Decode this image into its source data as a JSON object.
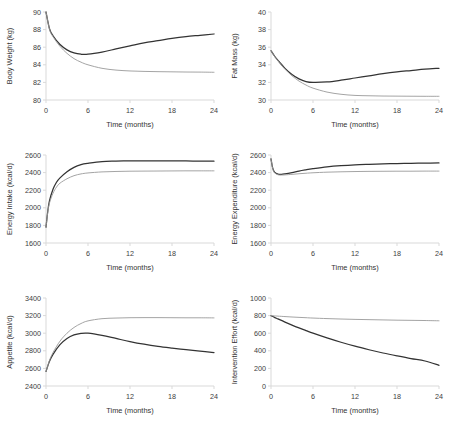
{
  "figure": {
    "width": 450,
    "height": 429,
    "background": "#ffffff",
    "series_colors": {
      "dark": "#333333",
      "light": "#9a9a9a"
    },
    "shared_xlabel": "Time (months)",
    "shared_xticks": [
      0,
      6,
      12,
      18,
      24
    ]
  },
  "chart_data": [
    {
      "type": "line",
      "title": "",
      "xlabel": "Time (months)",
      "ylabel": "Body Weight (kg)",
      "xlim": [
        0,
        24
      ],
      "ylim": [
        80,
        90
      ],
      "xticks": [
        0,
        6,
        12,
        18,
        24
      ],
      "yticks": [
        80,
        82,
        84,
        86,
        88,
        90
      ],
      "grid": false,
      "legend": "none",
      "x": [
        0,
        0.5,
        1,
        2,
        3,
        4,
        5,
        6,
        8,
        10,
        12,
        14,
        16,
        18,
        20,
        22,
        24
      ],
      "series": [
        {
          "name": "dark",
          "color": "#333333",
          "values": [
            90.0,
            88.1,
            87.3,
            86.3,
            85.7,
            85.35,
            85.2,
            85.2,
            85.45,
            85.8,
            86.15,
            86.5,
            86.75,
            87.0,
            87.2,
            87.35,
            87.5
          ]
        },
        {
          "name": "light",
          "color": "#9a9a9a",
          "values": [
            90.0,
            88.05,
            87.2,
            86.1,
            85.3,
            84.7,
            84.3,
            84.0,
            83.6,
            83.4,
            83.3,
            83.25,
            83.22,
            83.2,
            83.18,
            83.17,
            83.15
          ]
        }
      ]
    },
    {
      "type": "line",
      "title": "",
      "xlabel": "Time (months)",
      "ylabel": "Fat Mass (kg)",
      "xlim": [
        0,
        24
      ],
      "ylim": [
        30,
        40
      ],
      "xticks": [
        0,
        6,
        12,
        18,
        24
      ],
      "yticks": [
        30,
        32,
        34,
        36,
        38,
        40
      ],
      "grid": false,
      "legend": "none",
      "x": [
        0,
        0.5,
        1,
        2,
        3,
        4,
        5,
        6,
        8,
        10,
        12,
        14,
        16,
        18,
        20,
        22,
        24
      ],
      "series": [
        {
          "name": "dark",
          "color": "#333333",
          "values": [
            35.6,
            35.0,
            34.5,
            33.6,
            32.9,
            32.4,
            32.1,
            32.0,
            32.05,
            32.25,
            32.5,
            32.75,
            33.0,
            33.2,
            33.35,
            33.5,
            33.6
          ]
        },
        {
          "name": "light",
          "color": "#9a9a9a",
          "values": [
            35.6,
            34.95,
            34.45,
            33.5,
            32.75,
            32.15,
            31.7,
            31.35,
            30.9,
            30.65,
            30.52,
            30.48,
            30.45,
            30.44,
            30.43,
            30.42,
            30.42
          ]
        }
      ]
    },
    {
      "type": "line",
      "title": "",
      "xlabel": "Time (months)",
      "ylabel": "Energy Intake (kcal/d)",
      "xlim": [
        0,
        24
      ],
      "ylim": [
        1600,
        2600
      ],
      "xticks": [
        0,
        6,
        12,
        18,
        24
      ],
      "yticks": [
        1600,
        1800,
        2000,
        2200,
        2400,
        2600
      ],
      "grid": false,
      "legend": "none",
      "x": [
        0,
        0.25,
        0.5,
        1,
        1.5,
        2,
        3,
        4,
        5,
        6,
        8,
        10,
        12,
        14,
        16,
        18,
        20,
        22,
        24
      ],
      "series": [
        {
          "name": "dark",
          "color": "#333333",
          "values": [
            1780,
            1960,
            2080,
            2210,
            2290,
            2340,
            2410,
            2460,
            2490,
            2505,
            2525,
            2530,
            2533,
            2534,
            2534,
            2533,
            2532,
            2531,
            2530
          ]
        },
        {
          "name": "light",
          "color": "#9a9a9a",
          "values": [
            1780,
            1950,
            2055,
            2165,
            2235,
            2280,
            2330,
            2365,
            2385,
            2396,
            2408,
            2413,
            2416,
            2417,
            2418,
            2419,
            2420,
            2420,
            2420
          ]
        }
      ]
    },
    {
      "type": "line",
      "title": "",
      "xlabel": "Time (months)",
      "ylabel": "Energy Expenditure (kcal/d)",
      "xlim": [
        0,
        24
      ],
      "ylim": [
        1600,
        2600
      ],
      "xticks": [
        0,
        6,
        12,
        18,
        24
      ],
      "yticks": [
        1600,
        1800,
        2000,
        2200,
        2400,
        2600
      ],
      "grid": false,
      "legend": "none",
      "x": [
        0,
        0.25,
        0.5,
        1,
        1.5,
        2,
        3,
        4,
        5,
        6,
        8,
        10,
        12,
        14,
        16,
        18,
        20,
        22,
        24
      ],
      "series": [
        {
          "name": "dark",
          "color": "#333333",
          "values": [
            2555,
            2450,
            2405,
            2382,
            2380,
            2385,
            2400,
            2418,
            2432,
            2444,
            2464,
            2478,
            2488,
            2494,
            2499,
            2503,
            2506,
            2508,
            2510
          ]
        },
        {
          "name": "light",
          "color": "#9a9a9a",
          "values": [
            2555,
            2445,
            2398,
            2375,
            2372,
            2374,
            2380,
            2387,
            2393,
            2398,
            2405,
            2409,
            2412,
            2414,
            2415,
            2416,
            2416,
            2417,
            2417
          ]
        }
      ]
    },
    {
      "type": "line",
      "title": "",
      "xlabel": "Time (months)",
      "ylabel": "Appetite (kcal/d)",
      "xlim": [
        0,
        24
      ],
      "ylim": [
        2400,
        3400
      ],
      "xticks": [
        0,
        6,
        12,
        18,
        24
      ],
      "yticks": [
        2400,
        2600,
        2800,
        3000,
        3200,
        3400
      ],
      "grid": false,
      "legend": "none",
      "x": [
        0,
        0.5,
        1,
        2,
        3,
        4,
        5,
        6,
        8,
        10,
        12,
        14,
        16,
        18,
        20,
        22,
        24
      ],
      "series": [
        {
          "name": "dark",
          "color": "#333333",
          "values": [
            2565,
            2680,
            2760,
            2870,
            2940,
            2980,
            2998,
            3000,
            2975,
            2940,
            2905,
            2875,
            2850,
            2830,
            2812,
            2795,
            2780
          ]
        },
        {
          "name": "light",
          "color": "#9a9a9a",
          "values": [
            2565,
            2690,
            2780,
            2910,
            3000,
            3065,
            3110,
            3140,
            3165,
            3172,
            3176,
            3177,
            3177,
            3176,
            3175,
            3175,
            3174
          ]
        }
      ]
    },
    {
      "type": "line",
      "title": "",
      "xlabel": "Time (months)",
      "ylabel": "Intervention Effort (kcal/d)",
      "xlim": [
        0,
        24
      ],
      "ylim": [
        0,
        1000
      ],
      "xticks": [
        0,
        6,
        12,
        18,
        24
      ],
      "yticks": [
        0,
        200,
        400,
        600,
        800,
        1000
      ],
      "grid": false,
      "legend": "none",
      "x": [
        0,
        0.5,
        1,
        2,
        3,
        4,
        5,
        6,
        8,
        10,
        12,
        14,
        16,
        18,
        20,
        22,
        24
      ],
      "series": [
        {
          "name": "dark",
          "color": "#333333",
          "values": [
            800,
            780,
            762,
            726,
            692,
            660,
            630,
            600,
            546,
            497,
            452,
            412,
            375,
            342,
            311,
            284,
            235
          ]
        },
        {
          "name": "light",
          "color": "#9a9a9a",
          "values": [
            800,
            797,
            794,
            789,
            784,
            780,
            776,
            772,
            766,
            761,
            757,
            754,
            751,
            748,
            746,
            744,
            741
          ]
        }
      ]
    }
  ]
}
